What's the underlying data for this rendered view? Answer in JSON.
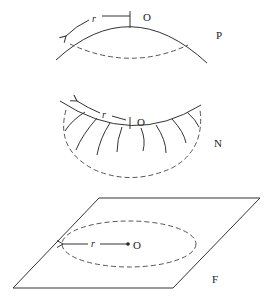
{
  "diagram": {
    "panels": [
      {
        "id": "P",
        "label": "P",
        "origin_label": "O",
        "radius_label": "r",
        "description": "positively curved surface (sphere cap) with geodesic circle"
      },
      {
        "id": "N",
        "label": "N",
        "origin_label": "O",
        "radius_label": "r",
        "description": "negatively curved surface (saddle) with geodesic circle"
      },
      {
        "id": "F",
        "label": "F",
        "origin_label": "O",
        "radius_label": "r",
        "description": "flat plane with circle of radius r"
      }
    ],
    "colors": {
      "stroke": "#333333",
      "dashed": "#555555",
      "background": "#ffffff"
    }
  }
}
